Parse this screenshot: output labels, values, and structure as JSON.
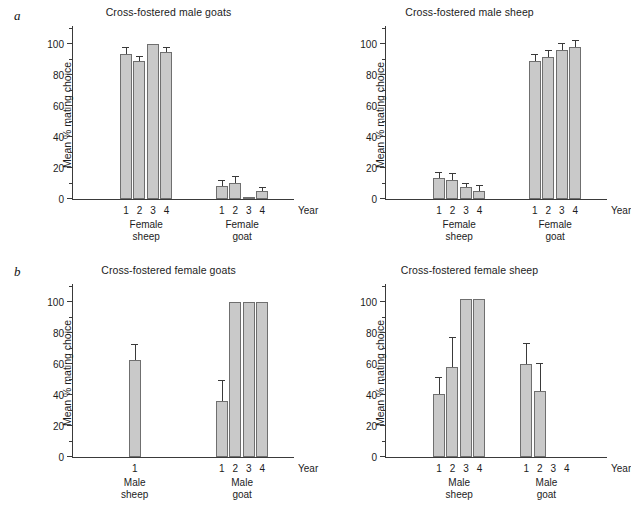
{
  "figure": {
    "panels": [
      {
        "letter": "a"
      },
      {
        "letter": "b"
      }
    ],
    "axis_title_y": "Mean % mating choice",
    "axis_title_x": "Year",
    "y_ticks": [
      "0",
      "20",
      "40",
      "60",
      "80",
      "100"
    ]
  },
  "chart_data": [
    {
      "id": "cross-fostered-male-goats",
      "type": "bar",
      "title": "Cross-fostered male goats",
      "panel": "a",
      "position": "left",
      "xlabel": "Year",
      "ylabel": "Mean % mating choice",
      "ylim": [
        0,
        100
      ],
      "ytick_values": [
        0,
        20,
        40,
        60,
        80,
        100
      ],
      "minor_tick_step": 10,
      "grid": false,
      "legend": "none",
      "groups": [
        {
          "name": "Female sheep",
          "label_lines": [
            "Female",
            "sheep"
          ],
          "categories": [
            "1",
            "2",
            "3",
            "4"
          ],
          "values": [
            94,
            89,
            100,
            95
          ],
          "errors": [
            3.5,
            3,
            0,
            2.5
          ]
        },
        {
          "name": "Female goat",
          "label_lines": [
            "Female",
            "goat"
          ],
          "categories": [
            "1",
            "2",
            "3",
            "4"
          ],
          "values": [
            8.5,
            10.5,
            0.8,
            5
          ],
          "errors": [
            3,
            4,
            0,
            2
          ]
        }
      ]
    },
    {
      "id": "cross-fostered-male-sheep",
      "type": "bar",
      "title": "Cross-fostered male sheep",
      "panel": "a",
      "position": "right",
      "xlabel": "Year",
      "ylabel": "Mean % mating choice",
      "ylim": [
        0,
        100
      ],
      "ytick_values": [
        0,
        20,
        40,
        60,
        80,
        100
      ],
      "minor_tick_step": 10,
      "grid": false,
      "legend": "none",
      "groups": [
        {
          "name": "Female sheep",
          "label_lines": [
            "Female",
            "sheep"
          ],
          "categories": [
            "1",
            "2",
            "3",
            "4"
          ],
          "values": [
            13.5,
            12.5,
            8,
            5
          ],
          "errors": [
            3.5,
            4,
            2,
            3.5
          ]
        },
        {
          "name": "Female goat",
          "label_lines": [
            "Female",
            "goat"
          ],
          "categories": [
            "1",
            "2",
            "3",
            "4"
          ],
          "values": [
            89,
            92,
            96.5,
            98.5
          ],
          "errors": [
            4,
            4,
            3.5,
            3.5
          ]
        }
      ]
    },
    {
      "id": "cross-fostered-female-goats",
      "type": "bar",
      "title": "Cross-fostered female goats",
      "panel": "b",
      "position": "left",
      "xlabel": "Year",
      "ylabel": "Mean % mating choice",
      "ylim": [
        0,
        100
      ],
      "ytick_values": [
        0,
        20,
        40,
        60,
        80,
        100
      ],
      "minor_tick_step": 10,
      "grid": false,
      "legend": "none",
      "groups": [
        {
          "name": "Male sheep",
          "label_lines": [
            "Male",
            "sheep"
          ],
          "categories": [
            "1"
          ],
          "values": [
            62.5
          ],
          "errors": [
            10
          ]
        },
        {
          "name": "Male goat",
          "label_lines": [
            "Male",
            "goat"
          ],
          "categories": [
            "1",
            "2",
            "3",
            "4"
          ],
          "values": [
            36,
            100,
            100,
            100
          ],
          "errors": [
            13,
            0,
            0,
            0
          ]
        }
      ]
    },
    {
      "id": "cross-fostered-female-sheep",
      "type": "bar",
      "title": "Cross-fostered female sheep",
      "panel": "b",
      "position": "right",
      "xlabel": "Year",
      "ylabel": "Mean % mating choice",
      "ylim": [
        0,
        100
      ],
      "ytick_values": [
        0,
        20,
        40,
        60,
        80,
        100
      ],
      "minor_tick_step": 10,
      "grid": false,
      "legend": "none",
      "groups": [
        {
          "name": "Male sheep",
          "label_lines": [
            "Male",
            "sheep"
          ],
          "categories": [
            "1",
            "2",
            "3",
            "4"
          ],
          "values": [
            41,
            58.5,
            102,
            102
          ],
          "errors": [
            10,
            18.5,
            0,
            0
          ]
        },
        {
          "name": "Male goat",
          "label_lines": [
            "Male",
            "goat"
          ],
          "categories": [
            "1",
            "2",
            "3",
            "4"
          ],
          "values": [
            60,
            42.5,
            null,
            null
          ],
          "errors": [
            13,
            18,
            null,
            null
          ]
        }
      ]
    }
  ],
  "colors": {
    "bar_fill": "#c9c9c9",
    "bar_stroke": "#6f6f6f",
    "axis": "#3a3a3a",
    "text": "#1c1c1c",
    "background": "#ffffff"
  }
}
